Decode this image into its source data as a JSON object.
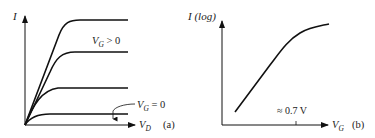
{
  "panel_a": {
    "y_label": "I",
    "x_label_main": "V",
    "x_label_sub": "D",
    "curve_label_top_main": "V",
    "curve_label_top_sub": "G",
    "curve_label_top_rel": " > 0",
    "curve_label_zero_main": "V",
    "curve_label_zero_sub": "G",
    "curve_label_zero_rel": " = 0",
    "panel_tag": "(a)",
    "curves_saturation_levels": [
      "highest",
      "high",
      "middle",
      "V_G = 0"
    ]
  },
  "panel_b": {
    "y_label": "I (log)",
    "x_label_main": "V",
    "x_label_sub": "G",
    "threshold_label": "≈ 0.7 V",
    "panel_tag": "(b)"
  },
  "colors": {
    "line": "#111111",
    "text": "#222222",
    "background": "#ffffff"
  }
}
